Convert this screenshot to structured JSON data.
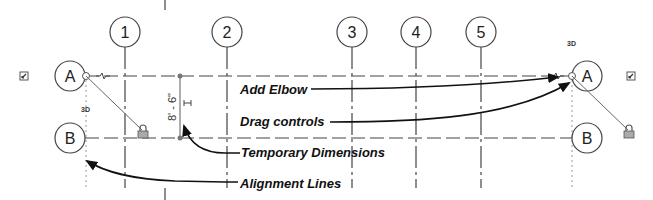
{
  "grid_columns": [
    {
      "label": "1",
      "x": 125
    },
    {
      "label": "2",
      "x": 227
    },
    {
      "label": "3",
      "x": 352
    },
    {
      "label": "4",
      "x": 416
    },
    {
      "label": "5",
      "x": 481
    }
  ],
  "grid_rows": [
    {
      "label": "A",
      "y": 76
    },
    {
      "label": "B",
      "y": 138
    }
  ],
  "left_bubbles": {
    "A": "A",
    "B": "B",
    "badge": "3D"
  },
  "right_bubbles": {
    "A": "A",
    "B": "B",
    "badge": "3D"
  },
  "temporary_dimension": "8' - 6\"",
  "callouts": {
    "add_elbow": "Add Elbow",
    "drag_controls": "Drag controls",
    "temporary_dimensions": "Temporary Dimensions",
    "alignment_lines": "Alignment Lines"
  },
  "colors": {
    "line": "#444444",
    "light_line": "#888888",
    "arrow": "#111111"
  }
}
